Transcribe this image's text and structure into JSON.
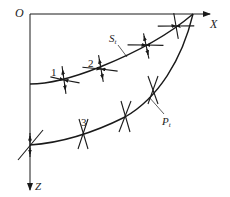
{
  "diagram": {
    "type": "stress-trajectory-diagram",
    "axes": {
      "origin_label": "O",
      "x_label": "X",
      "z_label": "Z"
    },
    "curves": [
      {
        "name": "S_t",
        "label_main": "S",
        "label_sub": "t"
      },
      {
        "name": "P_t",
        "label_main": "P",
        "label_sub": "t"
      }
    ],
    "points": [
      {
        "label": "1"
      },
      {
        "label": "2"
      },
      {
        "label": "3"
      }
    ],
    "colors": {
      "line": "#1a1a1a",
      "background": "#ffffff"
    }
  }
}
